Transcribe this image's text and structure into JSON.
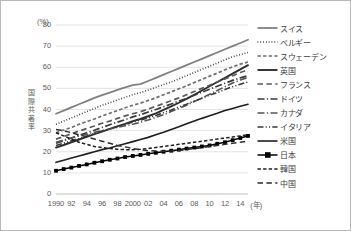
{
  "chart_data": {
    "type": "line",
    "title": "",
    "unit_label": "(%)",
    "ylabel": "国際共著率",
    "ylabel_chars": [
      "国",
      "際",
      "共",
      "著",
      "率"
    ],
    "xlabel": "(年)",
    "ylim": [
      0,
      80
    ],
    "yticks": [
      0,
      10,
      20,
      30,
      40,
      50,
      60,
      70,
      80
    ],
    "grid": true,
    "legend_position": "right",
    "x": [
      1990,
      1991,
      1992,
      1993,
      1994,
      1995,
      1996,
      1997,
      1998,
      1999,
      2000,
      2001,
      2002,
      2003,
      2004,
      2005,
      2006,
      2007,
      2008,
      2009,
      2010,
      2011,
      2012,
      2013,
      2014,
      2015
    ],
    "xticks": [
      "1990",
      "92",
      "94",
      "96",
      "98",
      "2000",
      "02",
      "04",
      "06",
      "08",
      "10",
      "12",
      "14"
    ],
    "xtick_years": [
      1990,
      1992,
      1994,
      1996,
      1998,
      2000,
      2002,
      2004,
      2006,
      2008,
      2010,
      2012,
      2014
    ],
    "series": [
      {
        "name": "スイス",
        "style": "solid",
        "color": "#808080",
        "width": 1.8,
        "marker": "none",
        "values": [
          38.0,
          39.5,
          41.0,
          42.5,
          44.0,
          45.5,
          46.8,
          48.0,
          49.3,
          50.5,
          51.5,
          52.0,
          53.5,
          55.0,
          56.5,
          58.0,
          59.5,
          61.0,
          62.5,
          64.0,
          65.5,
          67.0,
          68.5,
          70.0,
          71.5,
          73.0
        ]
      },
      {
        "name": "ベルギー",
        "style": "dotted",
        "color": "#3a3a3a",
        "width": 1.6,
        "marker": "none",
        "values": [
          33.0,
          34.5,
          36.0,
          37.5,
          39.0,
          40.5,
          42.0,
          43.2,
          44.5,
          45.8,
          47.0,
          48.0,
          49.2,
          50.5,
          51.8,
          53.0,
          54.5,
          56.0,
          57.5,
          59.0,
          60.5,
          62.0,
          63.5,
          65.0,
          66.0,
          67.0
        ]
      },
      {
        "name": "スウェーデン",
        "style": "dashed",
        "color": "#6e6e6e",
        "width": 1.7,
        "marker": "none",
        "values": [
          29.0,
          30.3,
          31.5,
          33.0,
          34.3,
          35.5,
          37.0,
          38.2,
          39.5,
          40.8,
          42.0,
          43.0,
          44.3,
          45.5,
          47.0,
          48.3,
          49.8,
          51.2,
          52.8,
          54.2,
          55.8,
          57.2,
          58.8,
          60.2,
          61.5,
          62.5
        ]
      },
      {
        "name": "英国",
        "style": "solid",
        "color": "#2d2d2d",
        "width": 1.9,
        "marker": "none",
        "values": [
          22.0,
          23.2,
          24.5,
          25.8,
          27.0,
          28.3,
          29.5,
          30.8,
          32.0,
          33.2,
          34.5,
          35.5,
          36.8,
          38.2,
          39.8,
          41.5,
          43.2,
          45.0,
          47.0,
          49.0,
          51.0,
          53.0,
          55.0,
          57.0,
          59.0,
          61.0
        ]
      },
      {
        "name": "フランス",
        "style": "dashed-long",
        "color": "#5a5a5a",
        "width": 1.7,
        "marker": "none",
        "values": [
          26.0,
          27.2,
          28.5,
          29.8,
          31.0,
          32.2,
          33.5,
          34.5,
          35.8,
          37.0,
          38.0,
          39.0,
          40.2,
          41.5,
          42.8,
          44.2,
          45.5,
          47.0,
          48.5,
          50.0,
          51.5,
          53.0,
          54.5,
          56.0,
          57.5,
          58.8
        ]
      },
      {
        "name": "ドイツ",
        "style": "dashdot",
        "color": "#3a3a3a",
        "width": 1.7,
        "marker": "none",
        "values": [
          24.0,
          25.2,
          26.5,
          27.8,
          29.0,
          30.2,
          31.5,
          32.8,
          34.0,
          35.2,
          36.5,
          37.5,
          38.8,
          40.0,
          41.3,
          42.6,
          44.0,
          45.3,
          46.8,
          48.2,
          49.6,
          51.0,
          52.4,
          53.8,
          55.0,
          56.0
        ]
      },
      {
        "name": "カナダ",
        "style": "dashdot",
        "color": "#555555",
        "width": 1.6,
        "marker": "none",
        "values": [
          24.5,
          25.5,
          26.5,
          27.5,
          28.3,
          29.2,
          30.0,
          30.8,
          31.5,
          32.3,
          33.0,
          34.0,
          35.0,
          36.3,
          37.5,
          39.0,
          40.5,
          42.0,
          43.8,
          45.5,
          47.2,
          49.0,
          50.8,
          52.5,
          54.0,
          55.2
        ]
      },
      {
        "name": "イタリア",
        "style": "dashdotdot",
        "color": "#3a3a3a",
        "width": 1.6,
        "marker": "none",
        "values": [
          23.0,
          24.0,
          25.2,
          26.3,
          27.5,
          28.6,
          29.8,
          30.8,
          32.0,
          33.0,
          34.0,
          35.0,
          36.0,
          37.2,
          38.5,
          39.8,
          41.2,
          42.5,
          44.0,
          45.3,
          46.8,
          48.0,
          49.5,
          50.8,
          52.0,
          53.0
        ]
      },
      {
        "name": "米国",
        "style": "solid",
        "color": "#1f1f1f",
        "width": 1.6,
        "marker": "none",
        "values": [
          15.0,
          16.0,
          17.0,
          18.0,
          19.0,
          20.0,
          21.0,
          21.8,
          22.8,
          23.8,
          24.8,
          25.8,
          26.8,
          28.0,
          29.2,
          30.5,
          31.8,
          33.2,
          34.5,
          35.8,
          37.0,
          38.2,
          39.5,
          40.5,
          41.5,
          42.5
        ]
      },
      {
        "name": "日本",
        "style": "solid-marker",
        "color": "#000000",
        "width": 1.5,
        "marker": "square",
        "values": [
          11.0,
          11.8,
          12.5,
          13.3,
          14.0,
          14.8,
          15.5,
          16.2,
          16.8,
          17.5,
          18.0,
          18.5,
          19.0,
          19.5,
          20.0,
          20.5,
          21.0,
          21.5,
          22.0,
          22.5,
          23.0,
          23.8,
          24.5,
          25.5,
          26.5,
          27.5
        ]
      },
      {
        "name": "韓国",
        "style": "dashed",
        "color": "#1f1f1f",
        "width": 1.5,
        "marker": "none",
        "values": [
          29.0,
          27.5,
          26.0,
          24.5,
          23.5,
          22.5,
          22.0,
          21.5,
          21.2,
          21.0,
          21.0,
          21.2,
          21.5,
          22.0,
          22.5,
          23.0,
          23.5,
          24.0,
          24.5,
          25.0,
          25.5,
          26.0,
          26.5,
          27.0,
          27.5,
          28.0
        ]
      },
      {
        "name": "中国",
        "style": "dashed-long",
        "color": "#2d2d2d",
        "width": 1.5,
        "marker": "none",
        "values": [
          30.5,
          30.0,
          29.0,
          28.0,
          27.0,
          26.0,
          25.0,
          24.0,
          23.0,
          22.3,
          21.5,
          21.0,
          20.5,
          20.3,
          20.2,
          20.3,
          20.6,
          21.0,
          21.5,
          22.0,
          22.5,
          23.0,
          23.5,
          24.0,
          24.5,
          25.0
        ]
      }
    ]
  }
}
